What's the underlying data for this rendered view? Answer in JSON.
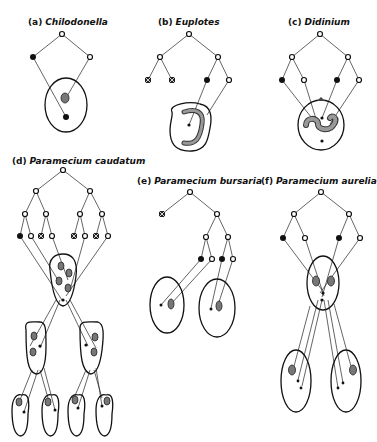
{
  "figure": {
    "panels": [
      {
        "tag": "(a)",
        "name": "Chilodonella"
      },
      {
        "tag": "(b)",
        "name": "Euplotes"
      },
      {
        "tag": "(c)",
        "name": "Didinium"
      },
      {
        "tag": "(d)",
        "name": "Paramecium caudatum"
      },
      {
        "tag": "(e)",
        "name": "Paramecium bursaria"
      },
      {
        "tag": "(f)",
        "name": "Paramecium aurelia"
      }
    ],
    "legend_symbols": {
      "open-circle": "surviving micronuclear product",
      "filled-circle": "micronucleus retained",
      "crossed-square": "degenerating nucleus",
      "stippled-oval": "macronucleus anlage"
    },
    "colors": {
      "ink": "#111111",
      "stipple": "#777777",
      "background": "#ffffff"
    }
  }
}
